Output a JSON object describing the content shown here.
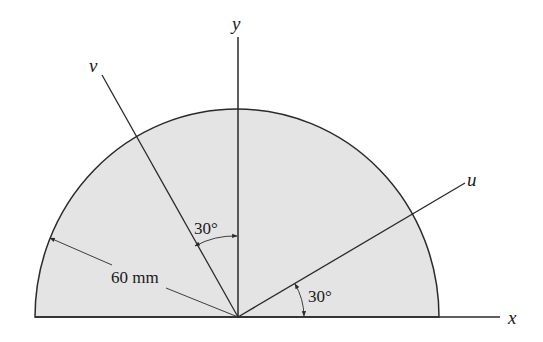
{
  "diagram": {
    "shape": "semicircle",
    "fill_color": "#e4e4e4",
    "stroke_color": "#2a2a2a",
    "axes": {
      "x_label": "x",
      "y_label": "y",
      "u_label": "u",
      "v_label": "v"
    },
    "dimensions": {
      "radius_label": "60 mm",
      "angle_v_from_y": "30°",
      "angle_u_from_x": "30°"
    }
  }
}
